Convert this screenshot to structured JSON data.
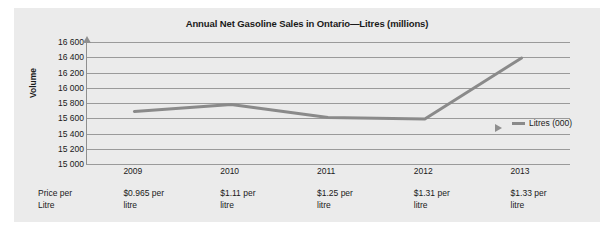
{
  "chart_data": {
    "type": "line",
    "title": "Annual Net Gasoline Sales in Ontario—Litres (millions)",
    "xlabel": "",
    "ylabel": "Volume",
    "categories": [
      "2009",
      "2010",
      "2011",
      "2012",
      "2013"
    ],
    "series": [
      {
        "name": "Litres (000)",
        "values": [
          15690,
          15780,
          15610,
          15590,
          16390
        ]
      }
    ],
    "ylim": [
      15000,
      16600
    ],
    "ytick_labels": [
      "15 000",
      "15 200",
      "15 400",
      "15 600",
      "15 800",
      "16 000",
      "16 200",
      "16 400",
      "16 600"
    ],
    "ytick_values": [
      15000,
      15200,
      15400,
      15600,
      15800,
      16000,
      16200,
      16400,
      16600
    ],
    "grid": true,
    "legend_position": "right-middle",
    "line_color": "#8a8a8a",
    "grid_color": "#9a9a9a",
    "background_color": "#ebebeb"
  },
  "legend": {
    "label": "Litres (000)"
  },
  "price_row": {
    "header_line1": "Price per",
    "header_line2": "Litre",
    "cells": [
      {
        "line1": "$0.965 per",
        "line2": "litre"
      },
      {
        "line1": "$1.11 per",
        "line2": "litre"
      },
      {
        "line1": "$1.25 per",
        "line2": "litre"
      },
      {
        "line1": "$1.31 per",
        "line2": "litre"
      },
      {
        "line1": "$1.33 per",
        "line2": "litre"
      }
    ]
  }
}
